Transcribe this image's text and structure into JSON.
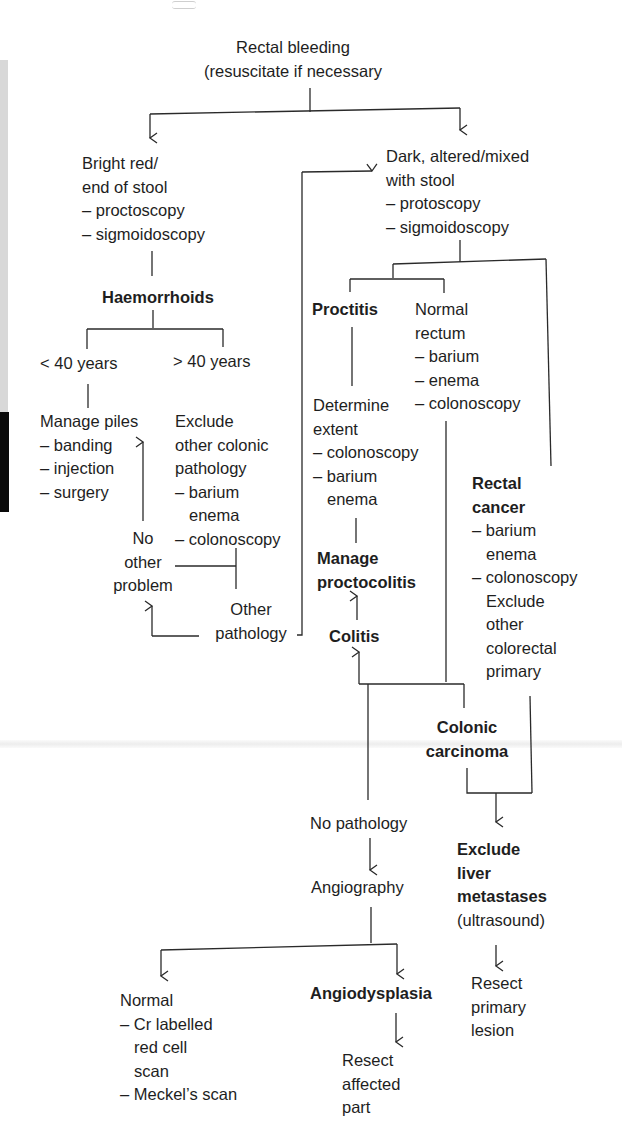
{
  "diagram": {
    "nodes": {
      "start": [
        "Rectal bleeding",
        "(resuscitate if necessary"
      ],
      "bright_red": [
        "Bright red/",
        "end of stool",
        "– proctoscopy",
        "– sigmoidoscopy"
      ],
      "dark": [
        "Dark, altered/mixed",
        "with stool",
        "– protoscopy",
        "– sigmoidoscopy"
      ],
      "haemorrhoids": "Haemorrhoids",
      "under40": "< 40 years",
      "over40": "> 40 years",
      "manage_piles": [
        "Manage piles",
        "– banding",
        "– injection",
        "– surgery"
      ],
      "exclude_other": [
        "Exclude",
        "other colonic",
        "pathology",
        "– barium",
        "enema",
        "– colonoscopy"
      ],
      "no_other_problem": [
        "No",
        "other",
        "problem"
      ],
      "other_pathology": [
        "Other",
        "pathology"
      ],
      "proctitis": "Proctitis",
      "normal_rectum": [
        "Normal",
        "rectum",
        "– barium",
        "– enema",
        "– colonoscopy"
      ],
      "determine_extent": [
        "Determine",
        "extent",
        "– colonoscopy",
        "– barium",
        "enema"
      ],
      "manage_proctocolitis": [
        "Manage",
        "proctocolitis"
      ],
      "colitis": "Colitis",
      "rectal_cancer": [
        "Rectal",
        "cancer",
        "– barium",
        "enema",
        "– colonoscopy",
        "Exclude",
        "other",
        "colorectal",
        "primary"
      ],
      "colonic_carcinoma": [
        "Colonic",
        "carcinoma"
      ],
      "no_pathology": "No pathology",
      "angiography": "Angiography",
      "exclude_liver": [
        "Exclude",
        "liver",
        "metastases",
        "(ultrasound)"
      ],
      "resect_primary": [
        "Resect",
        "primary",
        "lesion"
      ],
      "normal_scan": [
        "Normal",
        "– Cr labelled",
        "red cell",
        "scan",
        "– Meckel’s scan"
      ],
      "angiodysplasia": "Angiodysplasia",
      "resect_affected": [
        "Resect",
        "affected",
        "part"
      ]
    },
    "edges": [
      [
        "start",
        "bright_red"
      ],
      [
        "start",
        "dark"
      ],
      [
        "bright_red",
        "haemorrhoids"
      ],
      [
        "haemorrhoids",
        "under40"
      ],
      [
        "haemorrhoids",
        "over40"
      ],
      [
        "under40",
        "manage_piles"
      ],
      [
        "over40",
        "exclude_other"
      ],
      [
        "exclude_other",
        "no_other_problem"
      ],
      [
        "exclude_other",
        "other_pathology"
      ],
      [
        "no_other_problem",
        "manage_piles"
      ],
      [
        "other_pathology",
        "no_other_problem"
      ],
      [
        "other_pathology",
        "dark"
      ],
      [
        "dark",
        "proctitis"
      ],
      [
        "dark",
        "normal_rectum"
      ],
      [
        "dark",
        "rectal_cancer"
      ],
      [
        "proctitis",
        "determine_extent"
      ],
      [
        "determine_extent",
        "manage_proctocolitis"
      ],
      [
        "colitis",
        "manage_proctocolitis"
      ],
      [
        "normal_rectum",
        "colitis"
      ],
      [
        "normal_rectum",
        "colonic_carcinoma"
      ],
      [
        "normal_rectum",
        "no_pathology"
      ],
      [
        "colonic_carcinoma",
        "exclude_liver"
      ],
      [
        "rectal_cancer",
        "exclude_liver"
      ],
      [
        "exclude_liver",
        "resect_primary"
      ],
      [
        "no_pathology",
        "angiography"
      ],
      [
        "angiography",
        "normal_scan"
      ],
      [
        "angiography",
        "angiodysplasia"
      ],
      [
        "angiodysplasia",
        "resect_affected"
      ]
    ]
  }
}
